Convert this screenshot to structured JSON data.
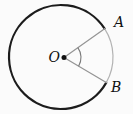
{
  "figure": {
    "type": "circle-with-central-angle",
    "labels": {
      "center": "O",
      "point_a": "A",
      "point_b": "B"
    },
    "geometry": {
      "canvas": {
        "width": 133,
        "height": 114
      },
      "circle": {
        "cx": 61,
        "cy": 57,
        "r": 52
      },
      "center_dot": {
        "cx": 64,
        "cy": 57.5,
        "r": 2.5
      },
      "point_a_angle_deg": -33,
      "point_b_angle_deg": 29.5,
      "angle_arc_radius": 17,
      "label_positions": {
        "center": {
          "x": 60,
          "y": 62,
          "anchor": "end"
        },
        "point_a": {
          "x": 114,
          "y": 27,
          "anchor": "start"
        },
        "point_b": {
          "x": 111,
          "y": 92,
          "anchor": "start"
        }
      }
    },
    "style": {
      "background": "#fbfbfb",
      "major_arc_color": "#1c1c1c",
      "major_arc_width": 2.2,
      "minor_arc_color": "#b3b3b3",
      "minor_arc_width": 1.2,
      "radius_color": "#949494",
      "radius_width": 1.2,
      "angle_arc_color": "#7a7a7a",
      "angle_arc_width": 1.1,
      "dot_color": "#111111",
      "label_color": "#111111"
    }
  }
}
